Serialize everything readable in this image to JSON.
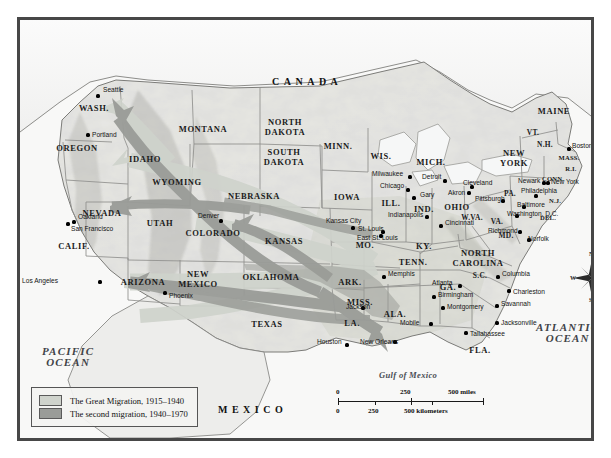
{
  "map": {
    "countries": [
      {
        "name": "CANADA",
        "x": 252,
        "y": 57
      },
      {
        "name": "MEXICO",
        "x": 198,
        "y": 385
      }
    ],
    "oceans": [
      {
        "name": "PACIFIC OCEAN",
        "line1": "PACIFIC",
        "line2": "OCEAN",
        "x": 22,
        "y": 326
      },
      {
        "name": "ATLANTIC OCEAN",
        "line1": "ATLANTIC",
        "line2": "OCEAN",
        "x": 516,
        "y": 302
      }
    ],
    "water_features": [
      {
        "name": "Gulf of Mexico",
        "x": 359,
        "y": 351
      }
    ],
    "states": [
      {
        "label": "WASH.",
        "x": 74,
        "y": 89,
        "size": "state"
      },
      {
        "label": "OREGON",
        "x": 57,
        "y": 129,
        "size": "state"
      },
      {
        "label": "IDAHO",
        "x": 125,
        "y": 140,
        "size": "state"
      },
      {
        "label": "MONTANA",
        "x": 183,
        "y": 110,
        "size": "state"
      },
      {
        "label": "NORTH DAKOTA",
        "x": 265,
        "y": 108,
        "size": "state",
        "lines": [
          "NORTH",
          "DAKOTA"
        ]
      },
      {
        "label": "SOUTH DAKOTA",
        "x": 264,
        "y": 138,
        "size": "state",
        "lines": [
          "SOUTH",
          "DAKOTA"
        ]
      },
      {
        "label": "MINN.",
        "x": 318,
        "y": 127,
        "size": "state"
      },
      {
        "label": "WIS.",
        "x": 361,
        "y": 137,
        "size": "state"
      },
      {
        "label": "MICH.",
        "x": 411,
        "y": 143,
        "size": "state"
      },
      {
        "label": "WYOMING",
        "x": 157,
        "y": 163,
        "size": "state"
      },
      {
        "label": "NEBRASKA",
        "x": 234,
        "y": 177,
        "size": "state"
      },
      {
        "label": "IOWA",
        "x": 327,
        "y": 178,
        "size": "state"
      },
      {
        "label": "ILL.",
        "x": 371,
        "y": 184,
        "size": "state"
      },
      {
        "label": "IND.",
        "x": 404,
        "y": 190,
        "size": "state"
      },
      {
        "label": "OHIO",
        "x": 437,
        "y": 188,
        "size": "state"
      },
      {
        "label": "NEVADA",
        "x": 82,
        "y": 194,
        "size": "state"
      },
      {
        "label": "UTAH",
        "x": 140,
        "y": 204,
        "size": "state"
      },
      {
        "label": "COLORADO",
        "x": 193,
        "y": 214,
        "size": "state"
      },
      {
        "label": "KANSAS",
        "x": 264,
        "y": 222,
        "size": "state"
      },
      {
        "label": "MO.",
        "x": 345,
        "y": 226,
        "size": "state"
      },
      {
        "label": "KY.",
        "x": 404,
        "y": 227,
        "size": "state"
      },
      {
        "label": "CALIF.",
        "x": 54,
        "y": 227,
        "size": "state"
      },
      {
        "label": "W.VA.",
        "x": 452,
        "y": 198,
        "size": "state sm"
      },
      {
        "label": "VA.",
        "x": 477,
        "y": 202,
        "size": "state sm"
      },
      {
        "label": "MD.",
        "x": 486,
        "y": 216,
        "size": "state sm"
      },
      {
        "label": "DEL.",
        "x": 528,
        "y": 198,
        "size": "state xs"
      },
      {
        "label": "N.J.",
        "x": 535,
        "y": 181,
        "size": "state xs"
      },
      {
        "label": "PA.",
        "x": 490,
        "y": 174,
        "size": "state sm"
      },
      {
        "label": "NEW YORK",
        "x": 494,
        "y": 139,
        "size": "state",
        "lines": [
          "NEW",
          "YORK"
        ]
      },
      {
        "label": "VT.",
        "x": 513,
        "y": 113,
        "size": "state sm"
      },
      {
        "label": "N.H.",
        "x": 525,
        "y": 125,
        "size": "state sm"
      },
      {
        "label": "MAINE",
        "x": 534,
        "y": 92,
        "size": "state"
      },
      {
        "label": "MASS.",
        "x": 549,
        "y": 138,
        "size": "state xs"
      },
      {
        "label": "R.I.",
        "x": 551,
        "y": 149,
        "size": "state xs"
      },
      {
        "label": "CONN.",
        "x": 533,
        "y": 159,
        "size": "state xs"
      },
      {
        "label": "ARIZONA",
        "x": 123,
        "y": 263,
        "size": "state"
      },
      {
        "label": "NEW MEXICO",
        "x": 178,
        "y": 260,
        "size": "state",
        "lines": [
          "NEW",
          "MEXICO"
        ]
      },
      {
        "label": "OKLAHOMA",
        "x": 251,
        "y": 258,
        "size": "state"
      },
      {
        "label": "ARK.",
        "x": 330,
        "y": 263,
        "size": "state"
      },
      {
        "label": "TENN.",
        "x": 393,
        "y": 243,
        "size": "state"
      },
      {
        "label": "NORTH CAROLINA",
        "x": 458,
        "y": 239,
        "size": "state",
        "lines": [
          "NORTH",
          "CAROLINA"
        ]
      },
      {
        "label": "S.C.",
        "x": 460,
        "y": 256,
        "size": "state sm"
      },
      {
        "label": "MISS.",
        "x": 340,
        "y": 283,
        "size": "state"
      },
      {
        "label": "ALA.",
        "x": 375,
        "y": 295,
        "size": "state"
      },
      {
        "label": "GA.",
        "x": 428,
        "y": 268,
        "size": "state"
      },
      {
        "label": "LA.",
        "x": 332,
        "y": 304,
        "size": "state"
      },
      {
        "label": "TEXAS",
        "x": 247,
        "y": 305,
        "size": "state"
      },
      {
        "label": "FLA.",
        "x": 460,
        "y": 331,
        "size": "state"
      }
    ],
    "cities": [
      {
        "name": "Seattle",
        "dot_x": 78,
        "dot_y": 76,
        "lx": 83,
        "ly": 71,
        "anchor": "left"
      },
      {
        "name": "Portland",
        "dot_x": 68,
        "dot_y": 115,
        "lx": 72,
        "ly": 116,
        "anchor": "left"
      },
      {
        "name": "Oakland",
        "dot_x": 54,
        "dot_y": 202,
        "lx": 58,
        "ly": 198,
        "anchor": "left"
      },
      {
        "name": "San Francisco",
        "dot_x": 48,
        "dot_y": 204,
        "lx": 51,
        "ly": 210,
        "anchor": "left"
      },
      {
        "name": "Los Angeles",
        "dot_x": 80,
        "dot_y": 262,
        "lx": 38,
        "ly": 262,
        "anchor": "right"
      },
      {
        "name": "Phoenix",
        "dot_x": 145,
        "dot_y": 273,
        "lx": 149,
        "ly": 277,
        "anchor": "left"
      },
      {
        "name": "Denver",
        "dot_x": 201,
        "dot_y": 201,
        "lx": 178,
        "ly": 197,
        "anchor": "left"
      },
      {
        "name": "Milwaukee",
        "dot_x": 390,
        "dot_y": 157,
        "lx": 352,
        "ly": 155,
        "anchor": "left"
      },
      {
        "name": "Chicago",
        "dot_x": 388,
        "dot_y": 170,
        "lx": 360,
        "ly": 167,
        "anchor": "left"
      },
      {
        "name": "Detroit",
        "dot_x": 425,
        "dot_y": 161,
        "lx": 402,
        "ly": 158,
        "anchor": "left"
      },
      {
        "name": "Gary",
        "dot_x": 394,
        "dot_y": 178,
        "lx": 400,
        "ly": 176,
        "anchor": "left"
      },
      {
        "name": "Akron",
        "dot_x": 449,
        "dot_y": 173,
        "lx": 428,
        "ly": 174,
        "anchor": "left"
      },
      {
        "name": "Cleveland",
        "dot_x": 452,
        "dot_y": 167,
        "lx": 443,
        "ly": 164,
        "anchor": "left"
      },
      {
        "name": "Pittsburgh",
        "dot_x": 483,
        "dot_y": 181,
        "lx": 455,
        "ly": 180,
        "anchor": "left"
      },
      {
        "name": "Indianapolis",
        "dot_x": 407,
        "dot_y": 197,
        "lx": 368,
        "ly": 196,
        "anchor": "left"
      },
      {
        "name": "Cincinnati",
        "dot_x": 421,
        "dot_y": 206,
        "lx": 425,
        "ly": 204,
        "anchor": "left"
      },
      {
        "name": "Kansas City",
        "dot_x": 333,
        "dot_y": 208,
        "lx": 306,
        "ly": 202,
        "anchor": "left"
      },
      {
        "name": "St. Louis",
        "dot_x": 363,
        "dot_y": 212,
        "lx": 338,
        "ly": 210,
        "anchor": "left"
      },
      {
        "name": "East St. Louis",
        "dot_x": 361,
        "dot_y": 216,
        "lx": 337,
        "ly": 219,
        "anchor": "left"
      },
      {
        "name": "Memphis",
        "dot_x": 364,
        "dot_y": 257,
        "lx": 368,
        "ly": 255,
        "anchor": "left"
      },
      {
        "name": "Newark",
        "dot_x": 524,
        "dot_y": 163,
        "lx": 498,
        "ly": 162,
        "anchor": "left"
      },
      {
        "name": "New York",
        "dot_x": 528,
        "dot_y": 163,
        "lx": 531,
        "ly": 163,
        "anchor": "left"
      },
      {
        "name": "Philadelphia",
        "dot_x": 516,
        "dot_y": 176,
        "lx": 501,
        "ly": 172,
        "anchor": "left"
      },
      {
        "name": "Baltimore",
        "dot_x": 504,
        "dot_y": 187,
        "lx": 497,
        "ly": 186,
        "anchor": "left"
      },
      {
        "name": "Washington, D.C.",
        "dot_x": 497,
        "dot_y": 196,
        "lx": 487,
        "ly": 195,
        "anchor": "left"
      },
      {
        "name": "Richmond",
        "dot_x": 500,
        "dot_y": 212,
        "lx": 468,
        "ly": 212,
        "anchor": "left"
      },
      {
        "name": "Norfolk",
        "dot_x": 509,
        "dot_y": 220,
        "lx": 508,
        "ly": 220,
        "anchor": "left"
      },
      {
        "name": "Boston",
        "dot_x": 549,
        "dot_y": 129,
        "lx": 552,
        "ly": 127,
        "anchor": "left"
      },
      {
        "name": "Columbia",
        "dot_x": 478,
        "dot_y": 257,
        "lx": 482,
        "ly": 255,
        "anchor": "left"
      },
      {
        "name": "Charleston",
        "dot_x": 489,
        "dot_y": 271,
        "lx": 493,
        "ly": 273,
        "anchor": "left"
      },
      {
        "name": "Savannah",
        "dot_x": 477,
        "dot_y": 286,
        "lx": 481,
        "ly": 285,
        "anchor": "left"
      },
      {
        "name": "Jacksonville",
        "dot_x": 477,
        "dot_y": 303,
        "lx": 481,
        "ly": 304,
        "anchor": "left"
      },
      {
        "name": "Atlanta",
        "dot_x": 440,
        "dot_y": 266,
        "lx": 412,
        "ly": 264,
        "anchor": "left"
      },
      {
        "name": "Birmingham",
        "dot_x": 414,
        "dot_y": 277,
        "lx": 418,
        "ly": 276,
        "anchor": "left"
      },
      {
        "name": "Montgomery",
        "dot_x": 423,
        "dot_y": 288,
        "lx": 427,
        "ly": 288,
        "anchor": "left"
      },
      {
        "name": "Jackson",
        "dot_x": 343,
        "dot_y": 288,
        "lx": 326,
        "ly": 288,
        "anchor": "left"
      },
      {
        "name": "Mobile",
        "dot_x": 411,
        "dot_y": 304,
        "lx": 380,
        "ly": 304,
        "anchor": "left"
      },
      {
        "name": "Tallahassee",
        "dot_x": 446,
        "dot_y": 313,
        "lx": 450,
        "ly": 315,
        "anchor": "left"
      },
      {
        "name": "New Orleans",
        "dot_x": 375,
        "dot_y": 322,
        "lx": 340,
        "ly": 323,
        "anchor": "left"
      },
      {
        "name": "Houston",
        "dot_x": 327,
        "dot_y": 325,
        "lx": 297,
        "ly": 323,
        "anchor": "left"
      }
    ]
  },
  "legend": {
    "items": [
      {
        "label": "The Great Migration, 1915–1940",
        "color": "#cfd3cc"
      },
      {
        "label": "The second migration, 1940–1970",
        "color": "#9a9c98"
      }
    ]
  },
  "scale": {
    "miles_label": "500 miles",
    "miles_ticks": [
      "0",
      "250"
    ],
    "km_label": "500 kilometers",
    "km_ticks": [
      "0",
      "250"
    ]
  },
  "compass": {
    "north": "N",
    "east": "E",
    "south": "S",
    "west": "W"
  },
  "colors": {
    "great_migration": "#cfd3cc",
    "second_migration": "#9a9c98",
    "frame": "#474747",
    "land": "#e9e9e6",
    "ocean": "#f7f7f6"
  }
}
